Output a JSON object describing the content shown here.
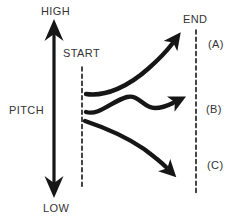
{
  "colors": {
    "ink": "#161616",
    "text": "#333333",
    "background": "#ffffff"
  },
  "pitch_axis": {
    "label": "PITCH",
    "high_label": "HIGH",
    "low_label": "LOW"
  },
  "timeline": {
    "start_label": "START",
    "end_label": "END"
  },
  "contours": [
    {
      "label": "(A)",
      "shape": "rising"
    },
    {
      "label": "(B)",
      "shape": "level with slight waver"
    },
    {
      "label": "(C)",
      "shape": "falling"
    }
  ]
}
